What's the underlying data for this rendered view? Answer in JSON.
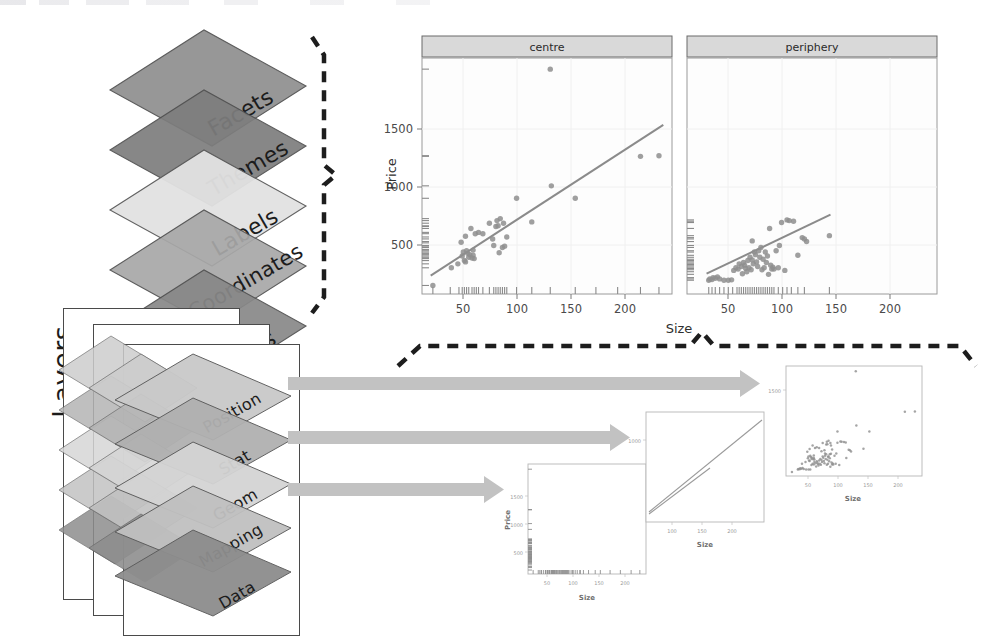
{
  "diagram": {
    "layers_word": "Layers",
    "plot_stack": [
      {
        "label": "Facets",
        "fill": "#8f8f8f"
      },
      {
        "label": "Themes",
        "fill": "#7d7d7d"
      },
      {
        "label": "Labels",
        "fill": "#e2e2e2"
      },
      {
        "label": "Coordinates",
        "fill": "#a8a8a8"
      },
      {
        "label": "Scales",
        "fill": "#888888"
      }
    ],
    "layer_stack": [
      {
        "label": "Position",
        "fill": "#c9c9c9"
      },
      {
        "label": "Stat",
        "fill": "#b0b0b0"
      },
      {
        "label": "Geom",
        "fill": "#d4d4d4"
      },
      {
        "label": "Mapping",
        "fill": "#c0c0c0"
      },
      {
        "label": "Data",
        "fill": "#8d8d8d"
      }
    ],
    "arrow_color": "#b9b9b9",
    "brace_color": "#1d1d1d"
  },
  "chart_data": [
    {
      "id": "main-faceted-scatter",
      "type": "scatter",
      "title": "",
      "xlabel": "Size",
      "ylabel": "Price",
      "xlim": [
        10,
        240
      ],
      "ylim": [
        100,
        1900
      ],
      "xticks": [
        50,
        100,
        150,
        200
      ],
      "yticks": [
        500,
        1000,
        1500
      ],
      "grid": true,
      "facet_variable": "location",
      "facets": [
        {
          "name": "centre",
          "fit_line": {
            "x": [
              18,
              232
            ],
            "y": [
              240,
              1390
            ]
          },
          "points": [
            [
              20,
              165
            ],
            [
              37,
              300
            ],
            [
              43,
              330
            ],
            [
              46,
              495
            ],
            [
              47,
              390
            ],
            [
              48,
              420
            ],
            [
              49,
              355
            ],
            [
              50,
              345
            ],
            [
              50,
              540
            ],
            [
              51,
              430
            ],
            [
              52,
              410
            ],
            [
              53,
              380
            ],
            [
              54,
              400
            ],
            [
              55,
              600
            ],
            [
              56,
              375
            ],
            [
              57,
              435
            ],
            [
              57,
              395
            ],
            [
              58,
              370
            ],
            [
              59,
              560
            ],
            [
              62,
              570
            ],
            [
              66,
              560
            ],
            [
              72,
              640
            ],
            [
              75,
              520
            ],
            [
              76,
              470
            ],
            [
              78,
              615
            ],
            [
              79,
              660
            ],
            [
              80,
              620
            ],
            [
              81,
              415
            ],
            [
              82,
              675
            ],
            [
              84,
              455
            ],
            [
              85,
              640
            ],
            [
              86,
              465
            ],
            [
              88,
              535
            ],
            [
              97,
              830
            ],
            [
              111,
              650
            ],
            [
              128,
              1815
            ],
            [
              129,
              925
            ],
            [
              151,
              830
            ],
            [
              211,
              1150
            ],
            [
              228,
              1155
            ]
          ],
          "x_rug": [
            20,
            36,
            44,
            47,
            49,
            51,
            53,
            56,
            58,
            60,
            62,
            66,
            72,
            76,
            78,
            80,
            82,
            84,
            86,
            88,
            97,
            111,
            128,
            151,
            170,
            190,
            211,
            228
          ],
          "y_rug": [
            165,
            300,
            330,
            355,
            370,
            380,
            390,
            400,
            410,
            420,
            430,
            440,
            455,
            465,
            470,
            490,
            500,
            520,
            535,
            560,
            570,
            600,
            615,
            620,
            640,
            660,
            675,
            830,
            925,
            1150,
            1155,
            1815
          ]
        },
        {
          "name": "periphery",
          "fit_line": {
            "x": [
              28,
              142
            ],
            "y": [
              255,
              705
            ]
          },
          "points": [
            [
              30,
              205
            ],
            [
              31,
              215
            ],
            [
              33,
              210
            ],
            [
              34,
              225
            ],
            [
              36,
              220
            ],
            [
              38,
              230
            ],
            [
              40,
              215
            ],
            [
              44,
              205
            ],
            [
              48,
              205
            ],
            [
              51,
              208
            ],
            [
              53,
              280
            ],
            [
              55,
              300
            ],
            [
              57,
              290
            ],
            [
              58,
              330
            ],
            [
              60,
              310
            ],
            [
              61,
              255
            ],
            [
              62,
              340
            ],
            [
              63,
              320
            ],
            [
              64,
              295
            ],
            [
              65,
              270
            ],
            [
              66,
              355
            ],
            [
              67,
              300
            ],
            [
              68,
              380
            ],
            [
              69,
              285
            ],
            [
              70,
              360
            ],
            [
              70,
              505
            ],
            [
              71,
              330
            ],
            [
              72,
              420
            ],
            [
              73,
              400
            ],
            [
              74,
              345
            ],
            [
              75,
              310
            ],
            [
              76,
              430
            ],
            [
              77,
              380
            ],
            [
              78,
              455
            ],
            [
              79,
              285
            ],
            [
              80,
              365
            ],
            [
              81,
              300
            ],
            [
              82,
              420
            ],
            [
              83,
              340
            ],
            [
              84,
              390
            ],
            [
              85,
              250
            ],
            [
              86,
              600
            ],
            [
              87,
              320
            ],
            [
              88,
              290
            ],
            [
              89,
              305
            ],
            [
              90,
              290
            ],
            [
              92,
              430
            ],
            [
              94,
              300
            ],
            [
              95,
              470
            ],
            [
              97,
              645
            ],
            [
              100,
              280
            ],
            [
              102,
              665
            ],
            [
              104,
              660
            ],
            [
              108,
              655
            ],
            [
              112,
              395
            ],
            [
              116,
              530
            ],
            [
              118,
              520
            ],
            [
              120,
              500
            ],
            [
              141,
              545
            ]
          ],
          "x_rug": [
            30,
            33,
            36,
            40,
            44,
            48,
            52,
            56,
            58,
            60,
            62,
            64,
            66,
            68,
            70,
            72,
            74,
            76,
            78,
            80,
            82,
            84,
            86,
            88,
            90,
            94,
            98,
            102,
            106,
            112,
            118,
            141
          ],
          "y_rug": [
            205,
            215,
            225,
            250,
            270,
            285,
            295,
            305,
            315,
            325,
            335,
            345,
            355,
            365,
            380,
            395,
            420,
            430,
            455,
            470,
            500,
            520,
            530,
            545,
            600,
            645,
            655,
            665
          ]
        }
      ]
    },
    {
      "id": "mini-data-plot",
      "type": "scatter",
      "note": "Data layer: rug marks only, empty panel",
      "xlabel": "Size",
      "ylabel": "Price",
      "xticks": [
        50,
        100,
        150,
        200
      ],
      "yticks": [
        500,
        1000,
        1500
      ],
      "points": []
    },
    {
      "id": "mini-stat-plot",
      "type": "line",
      "note": "Stat layer: two fitted regression lines",
      "xlabel": "Size",
      "ylabel": "",
      "xticks": [
        100,
        150,
        200
      ],
      "yticks": [
        1000
      ],
      "series": [
        {
          "name": "centre",
          "x": [
            18,
            232
          ],
          "y": [
            240,
            1390
          ]
        },
        {
          "name": "periphery",
          "x": [
            18,
            142
          ],
          "y": [
            215,
            760
          ]
        }
      ]
    },
    {
      "id": "mini-geom-plot",
      "type": "scatter",
      "note": "Geom layer: all points, unfaceted",
      "xlabel": "Size",
      "ylabel": "",
      "xticks": [
        50,
        100,
        150,
        200
      ],
      "yticks": [
        1500
      ]
    }
  ]
}
